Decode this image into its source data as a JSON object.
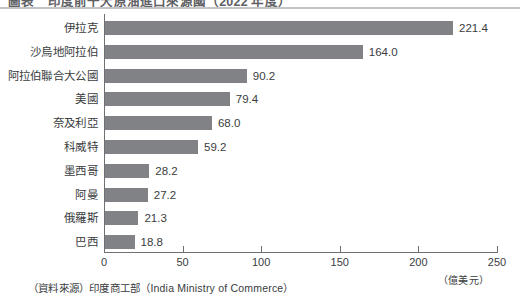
{
  "title": "圖表　印度前十大原油進口來源國（2022 年度）",
  "chart_data": {
    "type": "bar",
    "orientation": "horizontal",
    "title": "圖表　印度前十大原油進口來源國（2022 年度）",
    "xlabel": "（億美元）",
    "ylabel": "",
    "xlim": [
      0,
      250
    ],
    "xticks": [
      0,
      50,
      100,
      150,
      200,
      250
    ],
    "xtick_labels": [
      "0",
      "50",
      "100",
      "150",
      "200",
      "250"
    ],
    "grid": false,
    "legend": false,
    "bar_color": "#808285",
    "categories": [
      "伊拉克",
      "沙烏地阿拉伯",
      "阿拉伯聯合大公國",
      "美國",
      "奈及利亞",
      "科威特",
      "墨西哥",
      "阿曼",
      "俄羅斯",
      "巴西"
    ],
    "values": [
      221.4,
      164.0,
      90.2,
      79.4,
      68.0,
      59.2,
      28.2,
      27.2,
      21.3,
      18.8
    ],
    "value_labels": [
      "221.4",
      "164.0",
      "90.2",
      "79.4",
      "68.0",
      "59.2",
      "28.2",
      "27.2",
      "21.3",
      "18.8"
    ],
    "unit": "（億美元）",
    "source": "（資料來源）印度商工部（India Ministry of Commerce）"
  },
  "axis": {
    "unit_label": "（億美元）"
  },
  "footer": {
    "source": "（資料來源）印度商工部（India Ministry of Commerce）"
  }
}
